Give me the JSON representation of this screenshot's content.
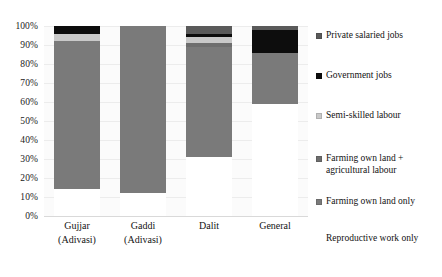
{
  "chart_data": {
    "type": "bar",
    "subtype": "stacked-percentage-column",
    "title": "",
    "subtitle": "",
    "xlabel": "",
    "ylabel": "",
    "ylim": [
      0,
      100
    ],
    "y_tick_labels": [
      "100%",
      "90%",
      "80%",
      "70%",
      "60%",
      "50%",
      "40%",
      "30%",
      "20%",
      "10%",
      "0%"
    ],
    "y_tick_values": [
      100,
      90,
      80,
      70,
      60,
      50,
      40,
      30,
      20,
      10,
      0
    ],
    "grid": true,
    "legend_position": "right",
    "categories": [
      "Gujjar\n(Adivasi)",
      "Gaddi\n(Adivasi)",
      "Dalit",
      "General"
    ],
    "category_lines": [
      [
        "Gujjar",
        "(Adivasi)"
      ],
      [
        "Gaddi",
        "(Adivasi)"
      ],
      [
        "Dalit",
        ""
      ],
      [
        "General",
        ""
      ]
    ],
    "series": [
      {
        "name": "Reproductive work only",
        "color": "#ffffff",
        "values": [
          14,
          12,
          31,
          59
        ]
      },
      {
        "name": "Farming own land only",
        "color": "#7a7a7a",
        "values": [
          78,
          88,
          58,
          27
        ]
      },
      {
        "name": "Farming own land + agricultural labour",
        "color": "#6e6e6e",
        "values": [
          0,
          0,
          2,
          0
        ]
      },
      {
        "name": "Semi-skilled labour",
        "color": "#c9c9c9",
        "values": [
          4,
          0,
          3,
          0
        ]
      },
      {
        "name": "Government jobs",
        "color": "#0d0d0d",
        "values": [
          4,
          0,
          2,
          12
        ]
      },
      {
        "name": "Private salaried jobs",
        "color": "#5a5a5a",
        "values": [
          0,
          0,
          4,
          2
        ]
      }
    ]
  },
  "legend": {
    "items": [
      {
        "label": "Private salaried jobs",
        "color": "#5a5a5a",
        "show_swatch": true
      },
      {
        "label": "Government jobs",
        "color": "#0d0d0d",
        "show_swatch": true
      },
      {
        "label": "Semi-skilled labour",
        "color": "#c9c9c9",
        "show_swatch": true
      },
      {
        "label": "Farming own land +\nagricultural labour",
        "color": "#6e6e6e",
        "show_swatch": true
      },
      {
        "label": "Farming own land only",
        "color": "#7a7a7a",
        "show_swatch": true
      },
      {
        "label": "Reproductive work only",
        "color": "#ffffff",
        "show_swatch": false
      }
    ]
  }
}
